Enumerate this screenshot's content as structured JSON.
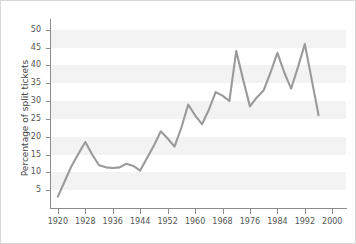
{
  "chart_data": {
    "type": "line",
    "title": "",
    "xlabel": "",
    "ylabel": "Percentage of split tickets",
    "xlim": [
      1918,
      2004
    ],
    "ylim": [
      0,
      53
    ],
    "grid": "horizontal-bands",
    "legend": "none",
    "line_color": "#9a9a9a",
    "x": [
      1920,
      1922,
      1924,
      1926,
      1928,
      1930,
      1932,
      1934,
      1936,
      1938,
      1940,
      1942,
      1944,
      1946,
      1948,
      1950,
      1952,
      1954,
      1956,
      1958,
      1960,
      1962,
      1964,
      1966,
      1968,
      1970,
      1972,
      1974,
      1976,
      1978,
      1980,
      1982,
      1984,
      1986,
      1988,
      1990,
      1992,
      1994,
      1996
    ],
    "values": [
      3.2,
      7.5,
      11.8,
      15.2,
      18.5,
      15.0,
      12.0,
      11.4,
      11.2,
      11.4,
      12.4,
      11.8,
      10.5,
      14.0,
      17.5,
      21.5,
      19.5,
      17.2,
      22.5,
      29.0,
      26.0,
      23.5,
      27.5,
      32.5,
      31.5,
      30.0,
      44.0,
      36.0,
      28.5,
      31.0,
      33.0,
      38.0,
      43.5,
      38.0,
      33.5,
      39.5,
      46.0,
      36.0,
      26.0
    ],
    "xticks": [
      1920,
      1928,
      1936,
      1944,
      1952,
      1960,
      1968,
      1976,
      1984,
      1992,
      2000
    ],
    "yticks": [
      5,
      10,
      15,
      20,
      25,
      30,
      35,
      40,
      45,
      50
    ],
    "colors": {
      "line": "#9a9a9a",
      "axis": "#8c8c8c",
      "tick_text": "#555555",
      "label_text": "#444444",
      "plot_bg": "#f3f3f3",
      "band": "#ffffff",
      "figure_border": "#d8d8d8"
    }
  }
}
